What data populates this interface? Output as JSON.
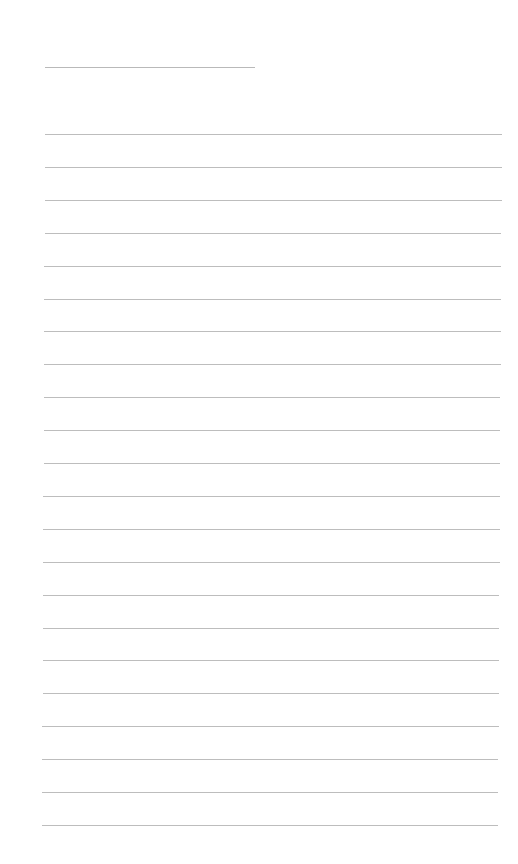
{
  "page": {
    "background": "#ffffff",
    "line_color": "#bdbdbd",
    "header_line": {
      "x1": 45,
      "x2": 255,
      "y": 67
    },
    "ruled_lines": {
      "count": 22,
      "first_y": 134,
      "spacing": 32.9,
      "x_start": [
        45,
        42
      ],
      "x_end": [
        502,
        498
      ]
    }
  }
}
